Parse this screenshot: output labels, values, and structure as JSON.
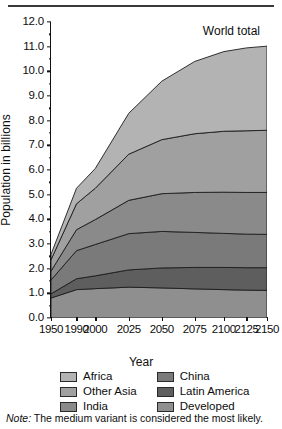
{
  "figure": {
    "world_total_label": "World total",
    "note_prefix": "Note:",
    "note_text": "The medium variant is considered the most likely."
  },
  "legend": {
    "items": [
      {
        "label": "Africa",
        "color": "#b3b3b3",
        "column": "left"
      },
      {
        "label": "Other Asia",
        "color": "#a0a0a0",
        "column": "left"
      },
      {
        "label": "India",
        "color": "#8a8a8a",
        "column": "left"
      },
      {
        "label": "China",
        "color": "#7a7a7a",
        "column": "right"
      },
      {
        "label": "Latin America",
        "color": "#5e5e5e",
        "column": "right"
      },
      {
        "label": "Developed",
        "color": "#8f8f8f",
        "column": "right"
      }
    ]
  },
  "chart_data": {
    "type": "area",
    "stacked": true,
    "title": "",
    "annotation": "World total",
    "xlabel": "Year",
    "ylabel": "Population in billions",
    "x": [
      1950,
      1990,
      2000,
      2025,
      2050,
      2075,
      2100,
      2125,
      2150
    ],
    "xtick_labels": [
      "1950",
      "1990",
      "2000",
      "2025",
      "2050",
      "2075",
      "2100",
      "2125",
      "2150"
    ],
    "ylim": [
      0.0,
      12.0
    ],
    "ytick_labels": [
      "0.0",
      "1.0",
      "2.0",
      "3.0",
      "4.0",
      "5.0",
      "6.0",
      "7.0",
      "8.0",
      "9.0",
      "10.0",
      "11.0",
      "12.0"
    ],
    "ytick_step": 1.0,
    "yminor_step": 0.5,
    "grid": false,
    "legend_position": "below",
    "stack_order_bottom_to_top": [
      "Developed",
      "Latin America",
      "China",
      "India",
      "Other Asia",
      "Africa"
    ],
    "series": [
      {
        "name": "Developed",
        "color": "#8f8f8f",
        "values": [
          0.81,
          1.15,
          1.19,
          1.25,
          1.22,
          1.18,
          1.15,
          1.13,
          1.12
        ]
      },
      {
        "name": "Latin America",
        "color": "#5e5e5e",
        "values": [
          0.17,
          0.44,
          0.52,
          0.7,
          0.81,
          0.87,
          0.9,
          0.91,
          0.92
        ]
      },
      {
        "name": "China",
        "color": "#7a7a7a",
        "values": [
          0.56,
          1.14,
          1.27,
          1.47,
          1.48,
          1.42,
          1.38,
          1.36,
          1.35
        ]
      },
      {
        "name": "India",
        "color": "#8a8a8a",
        "values": [
          0.36,
          0.85,
          1.01,
          1.35,
          1.53,
          1.62,
          1.67,
          1.69,
          1.7
        ]
      },
      {
        "name": "Other Asia",
        "color": "#a0a0a0",
        "values": [
          0.46,
          1.05,
          1.27,
          1.87,
          2.19,
          2.38,
          2.47,
          2.5,
          2.52
        ]
      },
      {
        "name": "Africa",
        "color": "#b3b3b3",
        "values": [
          0.22,
          0.63,
          0.8,
          1.66,
          2.37,
          2.93,
          3.23,
          3.36,
          3.41
        ]
      }
    ],
    "totals": [
      2.58,
      5.26,
      6.06,
      8.3,
      9.6,
      10.4,
      10.8,
      10.95,
      11.02
    ]
  }
}
